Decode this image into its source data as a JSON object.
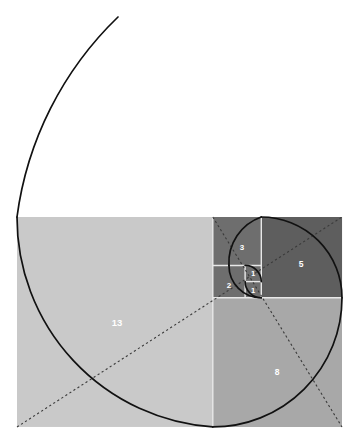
{
  "figure": {
    "type": "geometric-diagram",
    "canvas": {
      "width": 359,
      "height": 445,
      "background": "#ffffff"
    }
  },
  "colors": {
    "light_square": "#c9c9c9",
    "mid_square": "#a8a8a8",
    "dark_square": "#6e6e6e",
    "darker_square": "#5e5e5e",
    "grid_line": "#e8e8e8",
    "spiral_stroke": "#111111",
    "diagonal_stroke": "#3a3a3a",
    "label_text": "#ffffff",
    "background": "#ffffff"
  },
  "geometry": {
    "unit_px": 16.15,
    "rect": {
      "x": 17,
      "y": 217,
      "width": 324,
      "height": 210
    },
    "ratio_label": "21 : 13"
  },
  "squares": [
    {
      "name": "square-13",
      "label": "13",
      "fib": 13,
      "x": 17,
      "y": 217,
      "size": 209.95,
      "fill": "#c9c9c9",
      "label_x": 117,
      "label_y": 322
    },
    {
      "name": "square-8",
      "label": "8",
      "fib": 8,
      "x": 212.8,
      "y": 297.8,
      "size": 129.2,
      "fill": "#a8a8a8",
      "label_x": 277,
      "label_y": 372
    },
    {
      "name": "square-5",
      "label": "5",
      "fib": 5,
      "x": 261.3,
      "y": 217,
      "size": 80.75,
      "fill": "#5e5e5e",
      "label_x": 301,
      "label_y": 264
    },
    {
      "name": "square-3",
      "label": "3",
      "fib": 3,
      "x": 212.8,
      "y": 217,
      "size": 48.45,
      "fill": "#6e6e6e",
      "label_x": 242,
      "label_y": 247
    },
    {
      "name": "square-2",
      "label": "2",
      "fib": 2,
      "x": 212.8,
      "y": 265.45,
      "size": 32.3,
      "fill": "#6e6e6e",
      "label_x": 229,
      "label_y": 284
    },
    {
      "name": "square-1a",
      "label": "1",
      "fib": 1,
      "x": 245.1,
      "y": 281.6,
      "size": 16.15,
      "fill": "#6e6e6e",
      "label_x": 253,
      "label_y": 290
    },
    {
      "name": "square-1b",
      "label": "1",
      "fib": 1,
      "x": 245.1,
      "y": 265.45,
      "size": 16.15,
      "fill": "#6e6e6e",
      "label_x": 253,
      "label_y": 273
    }
  ],
  "spiral": {
    "description": "quarter-circle arcs joined through Fibonacci squares, plus outer 21-arc tail",
    "stroke_width": 1.7,
    "arcs": [
      {
        "fib": 1,
        "from": "1b"
      },
      {
        "fib": 1,
        "from": "1a"
      },
      {
        "fib": 2,
        "from": "2"
      },
      {
        "fib": 3,
        "from": "3"
      },
      {
        "fib": 5,
        "from": "5"
      },
      {
        "fib": 8,
        "from": "8"
      },
      {
        "fib": 13,
        "from": "13"
      },
      {
        "fib": 21,
        "from": "21-tail"
      }
    ]
  },
  "diagonals": {
    "style": "dotted",
    "stroke_width": 1.1,
    "description": "golden-ratio diagonals crossing the rectangles"
  },
  "labels": {
    "values": [
      "13",
      "8",
      "5",
      "3",
      "2",
      "1",
      "1"
    ]
  }
}
